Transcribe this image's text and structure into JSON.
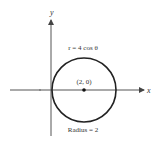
{
  "diagram": {
    "axes": {
      "x_label": "x",
      "y_label": "y"
    },
    "equation_label": "r = 4 cos θ",
    "center_label": "(2, 0)",
    "radius_label": "Radius = 2",
    "colors": {
      "stroke": "#222222",
      "axis": "#555555",
      "text": "#333333"
    }
  }
}
